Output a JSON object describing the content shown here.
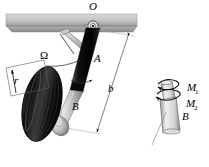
{
  "figure": {
    "background_color": "#ffffff",
    "line_color": "#000000",
    "panel_color": "#c9c9c9",
    "strut_upper_color": "#111111",
    "strut_lower_color": "#b8b8b8",
    "tire_color": "#1a1a1a"
  },
  "labels": {
    "pivot": "O",
    "spin_rate": "Ω",
    "strut_upper": "A",
    "strut_lower": "B",
    "wheel_radius": "r",
    "trail_length": "b",
    "moment_1_base": "M",
    "moment_1_sub": "1",
    "moment_2_base": "M",
    "moment_2_sub": "2",
    "detail_body": "B"
  },
  "parts": {
    "fuselage_panel": "fuselage-panel",
    "pivot_joint": "pivot-joint-O",
    "drag_link": "drag-link",
    "upper_strut": "upper-strut-A",
    "lower_strut": "lower-strut-B",
    "axle_fork": "axle-fork",
    "wheel": "wheel-tire",
    "radius_dimension": "radius-dimension-r",
    "length_dimension": "length-dimension-b",
    "omega_arrow": "omega-rotation-arrow",
    "detail_cylinder": "detail-cylinder-B",
    "moment_arrow_1": "moment-arrow-M1",
    "moment_arrow_2": "moment-arrow-M2"
  }
}
